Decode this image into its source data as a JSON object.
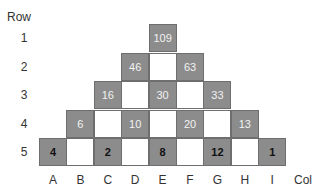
{
  "row_header": "Row",
  "col_header": "Col",
  "rows": [
    "1",
    "2",
    "3",
    "4",
    "5"
  ],
  "cols": [
    "A",
    "B",
    "C",
    "D",
    "E",
    "F",
    "G",
    "H",
    "I"
  ],
  "cells": [
    {
      "row": 1,
      "col": "E",
      "value": "109",
      "filled": true,
      "bold": false
    },
    {
      "row": 2,
      "col": "D",
      "value": "46",
      "filled": true,
      "bold": false
    },
    {
      "row": 2,
      "col": "E",
      "value": "",
      "filled": false,
      "bold": false
    },
    {
      "row": 2,
      "col": "F",
      "value": "63",
      "filled": true,
      "bold": false
    },
    {
      "row": 3,
      "col": "C",
      "value": "16",
      "filled": true,
      "bold": false
    },
    {
      "row": 3,
      "col": "D",
      "value": "",
      "filled": false,
      "bold": false
    },
    {
      "row": 3,
      "col": "E",
      "value": "30",
      "filled": true,
      "bold": false
    },
    {
      "row": 3,
      "col": "F",
      "value": "",
      "filled": false,
      "bold": false
    },
    {
      "row": 3,
      "col": "G",
      "value": "33",
      "filled": true,
      "bold": false
    },
    {
      "row": 4,
      "col": "B",
      "value": "6",
      "filled": true,
      "bold": false
    },
    {
      "row": 4,
      "col": "C",
      "value": "",
      "filled": false,
      "bold": false
    },
    {
      "row": 4,
      "col": "D",
      "value": "10",
      "filled": true,
      "bold": false
    },
    {
      "row": 4,
      "col": "E",
      "value": "",
      "filled": false,
      "bold": false
    },
    {
      "row": 4,
      "col": "F",
      "value": "20",
      "filled": true,
      "bold": false
    },
    {
      "row": 4,
      "col": "G",
      "value": "",
      "filled": false,
      "bold": false
    },
    {
      "row": 4,
      "col": "H",
      "value": "13",
      "filled": true,
      "bold": false
    },
    {
      "row": 5,
      "col": "A",
      "value": "4",
      "filled": true,
      "bold": true
    },
    {
      "row": 5,
      "col": "B",
      "value": "",
      "filled": false,
      "bold": false
    },
    {
      "row": 5,
      "col": "C",
      "value": "2",
      "filled": true,
      "bold": true
    },
    {
      "row": 5,
      "col": "D",
      "value": "",
      "filled": false,
      "bold": false
    },
    {
      "row": 5,
      "col": "E",
      "value": "8",
      "filled": true,
      "bold": true
    },
    {
      "row": 5,
      "col": "F",
      "value": "",
      "filled": false,
      "bold": false
    },
    {
      "row": 5,
      "col": "G",
      "value": "12",
      "filled": true,
      "bold": true
    },
    {
      "row": 5,
      "col": "H",
      "value": "",
      "filled": false,
      "bold": false
    },
    {
      "row": 5,
      "col": "I",
      "value": "1",
      "filled": true,
      "bold": true
    }
  ]
}
